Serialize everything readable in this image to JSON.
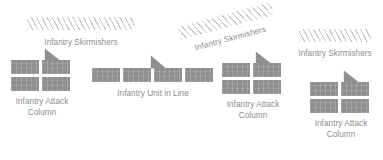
{
  "figure": {
    "type": "diagram",
    "background_color": "#ffffff",
    "block_color": "#8f8f8f",
    "hatch_color": "#c9c9c9",
    "label_color": "#8d8d8d"
  },
  "labels": {
    "skirmishers_left": "Infantry Skirmishers",
    "skirmishers_middle": "Infantry Skirmishers",
    "skirmishers_right": "Infantry Skirmishers",
    "attack_column_1": "Infantry Attack\nColumn",
    "unit_in_line": "Infantry Unit in Line",
    "attack_column_2": "Infantry Attack\nColumn",
    "attack_column_3": "Infantry Attack\nColumn"
  },
  "units": [
    {
      "name": "infantry-attack-column-1",
      "formation": "attack column",
      "rows": 2,
      "cols": 2,
      "blocks": 4,
      "label": "Infantry Attack\nColumn",
      "has_facing_marker": true
    },
    {
      "name": "infantry-unit-in-line",
      "formation": "line",
      "rows": 1,
      "cols": 4,
      "blocks": 4,
      "label": "Infantry Unit in Line",
      "has_facing_marker": true
    },
    {
      "name": "infantry-attack-column-2",
      "formation": "attack column",
      "rows": 2,
      "cols": 2,
      "blocks": 4,
      "label": "Infantry Attack\nColumn",
      "has_facing_marker": true
    },
    {
      "name": "infantry-attack-column-3",
      "formation": "attack column",
      "rows": 2,
      "cols": 2,
      "blocks": 4,
      "label": "Infantry Attack\nColumn",
      "has_facing_marker": true
    }
  ],
  "skirmisher_screens": [
    {
      "name": "skirmisher-screen-left",
      "label": "Infantry Skirmishers",
      "rotation_deg": 0
    },
    {
      "name": "skirmisher-screen-middle",
      "label": "Infantry Skirmishers",
      "rotation_deg": -15
    },
    {
      "name": "skirmisher-screen-right",
      "label": "Infantry Skirmishers",
      "rotation_deg": 0
    }
  ]
}
